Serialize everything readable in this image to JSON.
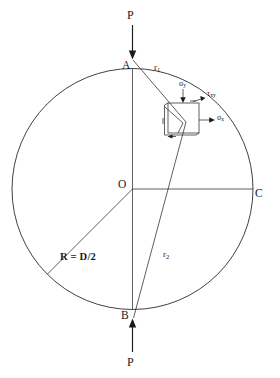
{
  "figure": {
    "line_color": "#2b2b2b",
    "text_color": "#1a1a1a",
    "background": "#ffffff"
  },
  "geometry": {
    "circle": {
      "cx": 132.5,
      "cy": 189,
      "r": 120.5
    },
    "point_a": {
      "x": 132.5,
      "y": 68.5
    },
    "point_b": {
      "x": 132.5,
      "y": 309.5
    },
    "point_o": {
      "x": 132.5,
      "y": 189
    },
    "point_c": {
      "x": 253,
      "y": 189
    },
    "element": {
      "x": 168,
      "y": 103,
      "w": 31,
      "h": 30
    }
  },
  "labels": {
    "load_top": "P",
    "load_bottom": "P",
    "point_a": "A",
    "point_b": "B",
    "point_o": "O",
    "point_c": "C",
    "radius": "R = D/2",
    "r1": "r",
    "r1_sub": "1",
    "r2": "r",
    "r2_sub": "2",
    "sigma_y": "σ",
    "sigma_y_sub": "y",
    "sigma_x": "σ",
    "sigma_x_sub": "x",
    "tau_xy": "τ",
    "tau_xy_sub": "xy"
  },
  "annotations": {
    "load_top_description": "Compressive point load P applied downward at A",
    "load_bottom_description": "Compressive point load P applied upward at B",
    "element_description": "Infinitesimal stress element showing sigma-x, sigma-y and tau-xy"
  }
}
